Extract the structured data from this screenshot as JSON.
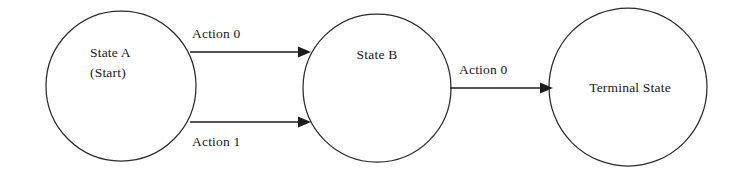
{
  "diagram": {
    "type": "state-transition-diagram",
    "background_color": "#ffffff",
    "stroke_color": "#2b2b2b",
    "text_color": "#171717",
    "nodes": [
      {
        "id": "state-a",
        "label_line1": "State A",
        "label_line2": "(Start)",
        "shape": "circle",
        "cx": 121,
        "cy": 86,
        "r": 75
      },
      {
        "id": "state-b",
        "label_line1": "State B",
        "label_line2": "",
        "shape": "circle",
        "cx": 377,
        "cy": 88,
        "r": 74
      },
      {
        "id": "terminal-state",
        "label_line1": "Terminal State",
        "label_line2": "",
        "shape": "circle",
        "cx": 628,
        "cy": 87,
        "r": 79
      }
    ],
    "edges": [
      {
        "id": "edge-a-b-action0",
        "label": "Action 0",
        "from": "state-a",
        "to": "state-b",
        "label_position": "above",
        "x1": 190,
        "y1": 52,
        "x2": 305,
        "y2": 52,
        "label_x": 192,
        "label_y": 38
      },
      {
        "id": "edge-a-b-action1",
        "label": "Action 1",
        "from": "state-a",
        "to": "state-b",
        "label_position": "below",
        "x1": 190,
        "y1": 122,
        "x2": 305,
        "y2": 122,
        "label_x": 192,
        "label_y": 146
      },
      {
        "id": "edge-b-terminal-action0",
        "label": "Action 0",
        "from": "state-b",
        "to": "terminal-state",
        "label_position": "above",
        "x1": 450,
        "y1": 88,
        "x2": 549,
        "y2": 88,
        "label_x": 459,
        "label_y": 74
      }
    ]
  }
}
